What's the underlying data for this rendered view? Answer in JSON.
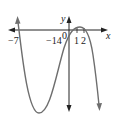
{
  "figure": {
    "type": "function-graph",
    "axes": {
      "x_label": "x",
      "y_label": "y",
      "origin_label": "0"
    },
    "tick_labels": {
      "x_neg7": "−7",
      "y_neg14": "−14",
      "x_1": "1",
      "x_2": "2"
    },
    "colors": {
      "curve": "#6e6e6e",
      "axes": "#222222",
      "background": "#ffffff"
    }
  }
}
